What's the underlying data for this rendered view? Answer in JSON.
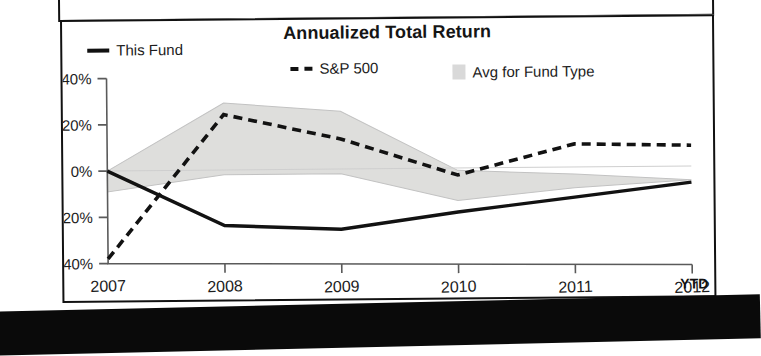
{
  "chart_data": {
    "type": "line",
    "title": "Annualized Total Return",
    "xlabel": "",
    "ylabel": "",
    "x": [
      "2007",
      "2008",
      "2009",
      "2010",
      "2011",
      "2012"
    ],
    "categories": [
      "2007",
      "2008",
      "2009",
      "2010",
      "2011",
      "2012"
    ],
    "ylim": [
      -40,
      40
    ],
    "ytick_labels": [
      "40%",
      "20%",
      "0%",
      "-20%",
      "-40%"
    ],
    "ytick_values": [
      40,
      20,
      0,
      -20,
      -40
    ],
    "xtick_labels": [
      "2007",
      "2008",
      "2009",
      "2010",
      "2011",
      "2012"
    ],
    "x_suffix_label": "YTD",
    "grid": false,
    "legend_position": "top",
    "series": [
      {
        "name": "This Fund",
        "style": "solid",
        "color": "#121212",
        "values": [
          0,
          -24,
          -26,
          -19,
          -13,
          -7
        ]
      },
      {
        "name": "S&P 500",
        "style": "dashed",
        "color": "#121212",
        "values": [
          -38,
          24,
          13,
          -3,
          10,
          9
        ]
      },
      {
        "name": "Avg for Fund Type",
        "style": "band",
        "color": "#dededc",
        "upper": [
          0,
          29,
          25,
          -1,
          -3,
          -6
        ],
        "lower": [
          -9,
          -2,
          -2,
          -14,
          -9,
          -6
        ]
      }
    ]
  },
  "legend": {
    "items": [
      {
        "label": "This Fund",
        "marker": "solid-line-swatch"
      },
      {
        "label": "S&P 500",
        "marker": "dashed-line-swatch"
      },
      {
        "label": "Avg for Fund Type",
        "marker": "gray-square-swatch"
      }
    ]
  },
  "colors": {
    "series_line": "#121212",
    "band_fill": "#dededc",
    "axis": "#5a5a5a",
    "frame": "#111111"
  }
}
